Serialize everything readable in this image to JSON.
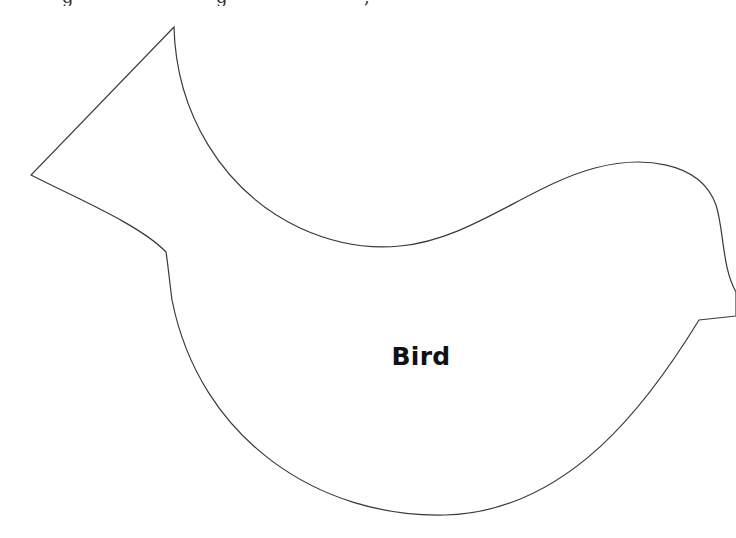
{
  "page": {
    "type": "cut-out template",
    "background_color": "#ffffff",
    "outline_color": "#3a3a3a"
  },
  "header": {
    "clipped_text_fragments": [
      "g",
      "g",
      ","
    ]
  },
  "shape": {
    "name": "bird",
    "label": "Bird",
    "parts": [
      "tail",
      "back",
      "head",
      "beak",
      "belly"
    ]
  }
}
